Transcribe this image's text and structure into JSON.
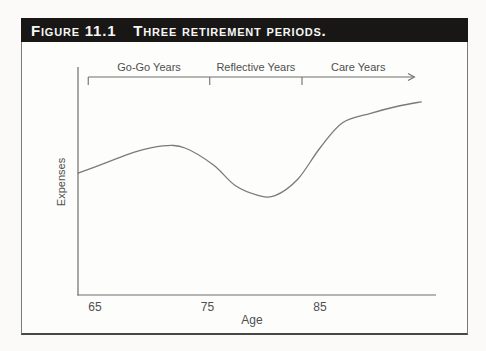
{
  "figure": {
    "label": "Figure 11.1",
    "caption": "Three retirement periods."
  },
  "chart_data": {
    "type": "line",
    "title": "Three retirement periods.",
    "xlabel": "Age",
    "ylabel": "Expenses",
    "x_ticks": [
      65,
      75,
      85
    ],
    "xlim": [
      63.5,
      95.5
    ],
    "ylim": [
      0,
      100
    ],
    "grid": false,
    "legend": false,
    "periods": [
      {
        "label": "Go-Go Years",
        "from_age": 64.4,
        "to_age": 75.2
      },
      {
        "label": "Reflective Years",
        "from_age": 75.2,
        "to_age": 83.4
      },
      {
        "label": "Care Years",
        "from_age": 83.4,
        "to_age": 93.4,
        "arrow_end": true
      }
    ],
    "series": [
      {
        "name": "Expenses",
        "points": [
          [
            63.5,
            58
          ],
          [
            66,
            63
          ],
          [
            68.5,
            68
          ],
          [
            71,
            71
          ],
          [
            73,
            70
          ],
          [
            75.5,
            62
          ],
          [
            77.5,
            52
          ],
          [
            79.5,
            47.5
          ],
          [
            81,
            47.3
          ],
          [
            83,
            55
          ],
          [
            85,
            70
          ],
          [
            87,
            82
          ],
          [
            89.5,
            86.5
          ],
          [
            92,
            90
          ],
          [
            94,
            92
          ]
        ]
      }
    ],
    "colors": {
      "title_bar_bg": "#181716",
      "title_bar_text": "#f6f6f4",
      "axis": "#6f6f6f",
      "curve": "#7a7a7a",
      "text": "#4f4f4f",
      "box_border": "#7a7a7a"
    }
  }
}
